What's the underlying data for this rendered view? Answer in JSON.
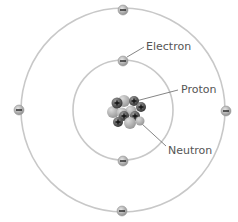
{
  "diagram": {
    "center": [
      123,
      110
    ],
    "orbits": [
      {
        "name": "inner-orbit",
        "radius": 51
      },
      {
        "name": "outer-orbit",
        "radius": 102
      }
    ],
    "electrons": [
      {
        "orbit": "outer",
        "cx": 123,
        "cy": 10,
        "symbol": "−"
      },
      {
        "orbit": "outer",
        "cx": 19,
        "cy": 110,
        "symbol": "−"
      },
      {
        "orbit": "outer",
        "cx": 226,
        "cy": 111,
        "symbol": "−"
      },
      {
        "orbit": "outer",
        "cx": 122,
        "cy": 211,
        "symbol": "−"
      },
      {
        "orbit": "inner",
        "cx": 123,
        "cy": 61,
        "symbol": "−"
      },
      {
        "orbit": "inner",
        "cx": 123,
        "cy": 161,
        "symbol": "−"
      }
    ],
    "labels": {
      "electron": "Electron",
      "proton": "Proton",
      "neutron": "Neutron"
    },
    "colors": {
      "orbit": "#c8c8c8",
      "electron_fill": "#b8b8b8",
      "proton_fill": "#5a5a5a",
      "neutron_fill": "#b5b5b5",
      "label_text": "#555555",
      "leader_line": "#666666"
    }
  }
}
